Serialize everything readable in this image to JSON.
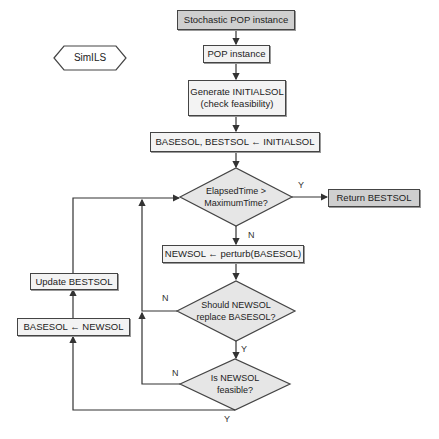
{
  "diagram": {
    "title_tag": "SimILS",
    "nodes": {
      "stochastic": "Stochastic POP instance",
      "pop": "POP instance",
      "generate_line1": "Generate INITIALSOL",
      "generate_line2": "(check feasibility)",
      "init_assign": "BASESOL, BESTSOL ← INITIALSOL",
      "time_check_line1": "ElapsedTime >",
      "time_check_line2": "MaximumTime?",
      "return_best": "Return BESTSOL",
      "perturb": "NEWSOL ← perturb(BASESOL)",
      "replace_check_line1": "Should NEWSOL",
      "replace_check_line2": "replace BASESOL?",
      "feasible_check_line1": "Is NEWSOL",
      "feasible_check_line2": "feasible?",
      "update_best": "Update BESTSOL",
      "base_assign": "BASESOL ← NEWSOL"
    },
    "edge_labels": {
      "time_yes": "Y",
      "time_no": "N",
      "replace_no": "N",
      "replace_yes": "Y",
      "feasible_no": "N",
      "feasible_yes": "Y"
    },
    "colors": {
      "line": "#444444",
      "box_fill": "#f3f3f3",
      "highlight_fill": "#cfcfcf",
      "diamond_fill": "#e6e6e6"
    }
  }
}
